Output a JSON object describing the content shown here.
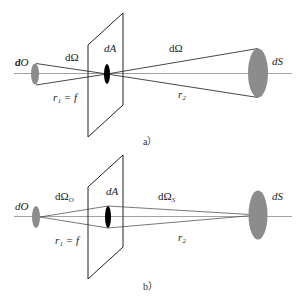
{
  "figure": {
    "panels": [
      {
        "id": "a",
        "caption": "a）",
        "labels": {
          "object_element": "dO",
          "solid_angle_object": "dΩ",
          "aperture_element": "dA",
          "solid_angle_source": "dΩ",
          "source_element": "dS",
          "r1": "r₁ = f",
          "r2": "r₂"
        }
      },
      {
        "id": "b",
        "caption": "b）",
        "labels": {
          "object_element": "dO",
          "solid_angle_object": "dΩ",
          "solid_angle_object_sub": "O",
          "aperture_element": "dA",
          "solid_angle_source": "dΩ",
          "solid_angle_source_sub": "S",
          "source_element": "dS",
          "r1": "r₁ = f",
          "r2": "r₂"
        }
      }
    ],
    "colors": {
      "axis": "#8a8a8a",
      "ray": "#333333",
      "plane": "#222222",
      "ellipse_fill": "#8c8c8c",
      "aperture_fill": "#000000"
    }
  }
}
